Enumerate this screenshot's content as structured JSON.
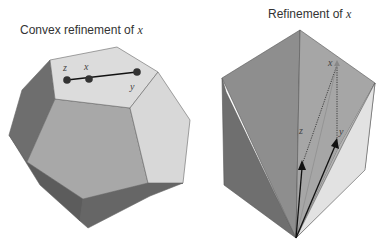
{
  "figures": [
    {
      "id": "left",
      "title_prefix": "Convex refinement of ",
      "title_var": "x",
      "shape": "dodecahedron",
      "points": [
        {
          "label": "z",
          "x": 67,
          "y": 80
        },
        {
          "label": "x",
          "x": 89,
          "y": 79
        },
        {
          "label": "y",
          "x": 137,
          "y": 72
        }
      ]
    },
    {
      "id": "right",
      "title_prefix": "Refinement of ",
      "title_var": "x",
      "shape": "rhombohedron",
      "vectors": [
        {
          "label": "z"
        },
        {
          "label": "y"
        }
      ],
      "apex_label": "x"
    }
  ],
  "colors": {
    "face_light": "#d9d9d9",
    "face_mid": "#a9a9a9",
    "face_dark": "#777777",
    "face_darker": "#666666",
    "edge": "#555555",
    "line": "#111111"
  }
}
